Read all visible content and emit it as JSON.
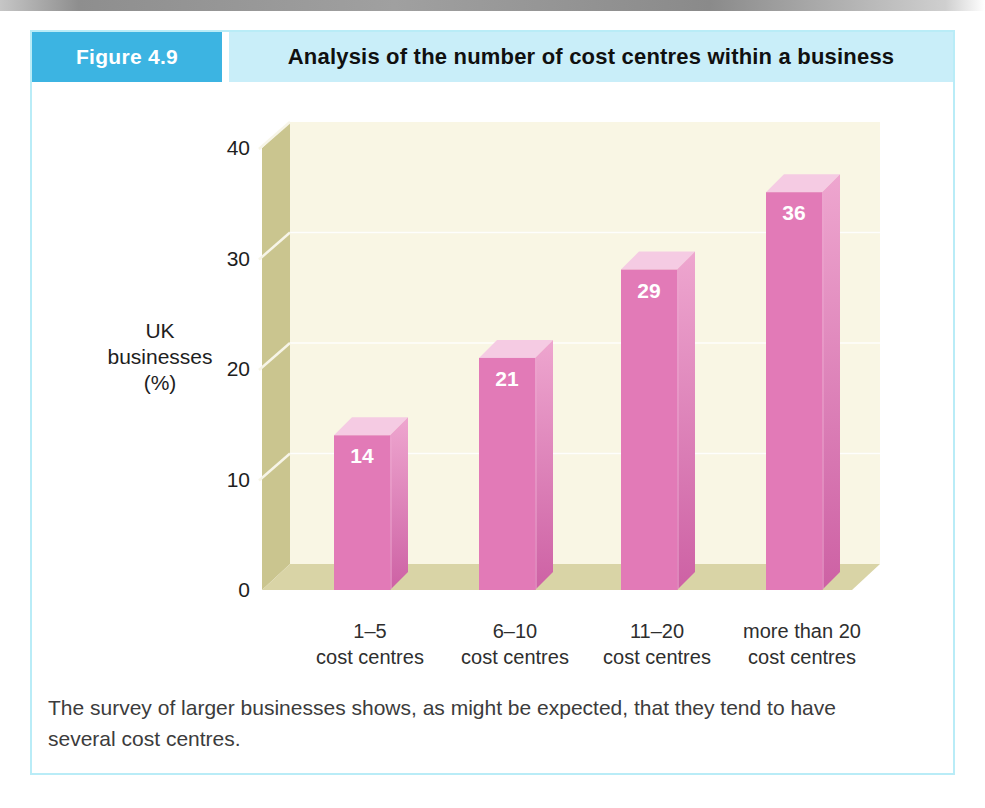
{
  "page": {
    "figure_label": "Figure 4.9",
    "figure_title": "Analysis of the number of cost centres within a business",
    "caption_lines": [
      "The survey of larger businesses shows, as might be expected, that they tend to have",
      "several cost centres."
    ]
  },
  "chart_data": {
    "type": "bar",
    "style": "3d-column",
    "title": "Analysis of the number of cost centres within a business",
    "categories": [
      "1–5 cost centres",
      "6–10 cost centres",
      "11–20 cost centres",
      "more than 20 cost centres"
    ],
    "category_lines": [
      [
        "1–5",
        "cost centres"
      ],
      [
        "6–10",
        "cost centres"
      ],
      [
        "11–20",
        "cost centres"
      ],
      [
        "more than 20",
        "cost centres"
      ]
    ],
    "values": [
      14,
      21,
      29,
      36
    ],
    "value_labels": [
      "14",
      "21",
      "29",
      "36"
    ],
    "ylabel": "UK businesses (%)",
    "ylabel_lines": [
      "UK",
      "businesses",
      "(%)"
    ],
    "ylim": [
      0,
      40
    ],
    "yticks": [
      0,
      10,
      20,
      30,
      40
    ],
    "grid": true,
    "legend": "none"
  },
  "colors": {
    "accent_blue": "#3cb4e2",
    "header_strip": "#c9eef9",
    "panel_border": "#b9ecf7",
    "plot_bg": "#f9f6e4",
    "wall": "#cac58f",
    "floor": "#d9d4a6",
    "grid": "#ffffff",
    "bar_front": "#e27ab7",
    "bar_side_light": "#eea6cf",
    "bar_side_dark": "#cd61a4",
    "bar_top": "#f5cbe3",
    "value_label": "#ffffff",
    "tick_text": "#1e1e1e",
    "category_text": "#2e2e2e",
    "caption_text": "#3c3c3c"
  }
}
